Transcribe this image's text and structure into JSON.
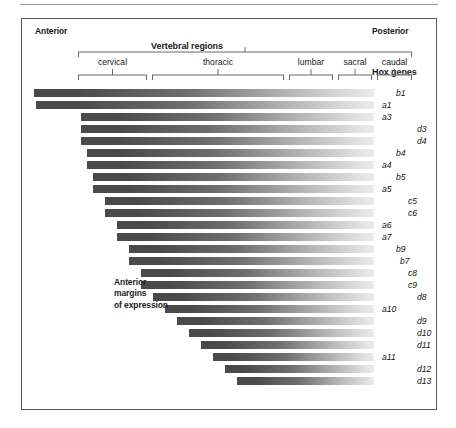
{
  "figure": {
    "anterior_label": "Anterior",
    "posterior_label": "Posterior",
    "vertebral_regions_label": "Vertebral regions",
    "hox_genes_label": "Hox genes",
    "anterior_margins_label": "Anterior\nmargins\nof expression",
    "regions": [
      {
        "name": "cervical",
        "x0": 56,
        "x1": 125
      },
      {
        "name": "thoracic",
        "x0": 130,
        "x1": 262
      },
      {
        "name": "lumbar",
        "x0": 267,
        "x1": 311
      },
      {
        "name": "sacral",
        "x0": 316,
        "x1": 350
      },
      {
        "name": "caudal",
        "x0": 355,
        "x1": 390
      }
    ],
    "bracket_span": {
      "x0": 56,
      "x1": 390
    },
    "bar_right_edge": 352,
    "colors": {
      "bar_dark": "#4a4a4a",
      "bar_light": "#ececec",
      "frame": "#5a5a5a",
      "rule": "#9a9a9a",
      "text": "#1a1a1a"
    }
  },
  "chart_data": {
    "type": "bar",
    "xlabel": "Vertebral regions (anterior → posterior)",
    "ylabel": "Hox genes",
    "grid": false,
    "legend": "none",
    "orientation": "horizontal",
    "note": "Each horizontal bar begins at the anterior margin of expression for that Hox gene and fades posteriorly. x values are pixel offsets inside the framed panel; bars all terminate at the same posterior (right) edge.",
    "categories": [
      "b1",
      "a1",
      "a3",
      "d3",
      "d4",
      "b4",
      "a4",
      "b5",
      "a5",
      "c5",
      "c6",
      "a6",
      "a7",
      "b9",
      "b7",
      "c8",
      "c9",
      "d8",
      "a10",
      "d9",
      "d10",
      "d11",
      "a11",
      "d12",
      "d13"
    ],
    "series": [
      {
        "name": "anterior margin (x start, px within panel)",
        "values": [
          12,
          14,
          59,
          59,
          59,
          65,
          65,
          71,
          71,
          83,
          83,
          95,
          95,
          107,
          107,
          119,
          119,
          131,
          143,
          155,
          167,
          179,
          191,
          203,
          215
        ]
      },
      {
        "name": "bar row y (px within panel)",
        "values": [
          70,
          82,
          94,
          106,
          118,
          130,
          142,
          154,
          166,
          178,
          190,
          202,
          214,
          226,
          238,
          250,
          262,
          274,
          286,
          298,
          310,
          322,
          334,
          346,
          358
        ]
      }
    ],
    "bars": [
      {
        "gene": "b1",
        "x": 12,
        "y": 70,
        "label_x": 40
      },
      {
        "gene": "a1",
        "x": 14,
        "y": 82,
        "label_x": 26
      },
      {
        "gene": "a3",
        "x": 59,
        "y": 94,
        "label_x": 26
      },
      {
        "gene": "d3",
        "x": 59,
        "y": 106,
        "label_x": 61
      },
      {
        "gene": "d4",
        "x": 59,
        "y": 118,
        "label_x": 61
      },
      {
        "gene": "b4",
        "x": 65,
        "y": 130,
        "label_x": 40
      },
      {
        "gene": "a4",
        "x": 65,
        "y": 142,
        "label_x": 26
      },
      {
        "gene": "b5",
        "x": 71,
        "y": 154,
        "label_x": 40
      },
      {
        "gene": "a5",
        "x": 71,
        "y": 166,
        "label_x": 26
      },
      {
        "gene": "c5",
        "x": 83,
        "y": 178,
        "label_x": 52
      },
      {
        "gene": "c6",
        "x": 83,
        "y": 190,
        "label_x": 52
      },
      {
        "gene": "a6",
        "x": 95,
        "y": 202,
        "label_x": 26
      },
      {
        "gene": "a7",
        "x": 95,
        "y": 214,
        "label_x": 26
      },
      {
        "gene": "b9",
        "x": 107,
        "y": 226,
        "label_x": 40
      },
      {
        "gene": "b7",
        "x": 107,
        "y": 238,
        "label_x": 44
      },
      {
        "gene": "c8",
        "x": 119,
        "y": 250,
        "label_x": 52
      },
      {
        "gene": "c9",
        "x": 119,
        "y": 262,
        "label_x": 52
      },
      {
        "gene": "d8",
        "x": 131,
        "y": 274,
        "label_x": 61
      },
      {
        "gene": "a10",
        "x": 143,
        "y": 286,
        "label_x": 26
      },
      {
        "gene": "d9",
        "x": 155,
        "y": 298,
        "label_x": 61
      },
      {
        "gene": "d10",
        "x": 167,
        "y": 310,
        "label_x": 61
      },
      {
        "gene": "d11",
        "x": 179,
        "y": 322,
        "label_x": 61
      },
      {
        "gene": "a11",
        "x": 191,
        "y": 334,
        "label_x": 26
      },
      {
        "gene": "d12",
        "x": 203,
        "y": 346,
        "label_x": 61
      },
      {
        "gene": "d13",
        "x": 215,
        "y": 358,
        "label_x": 61
      }
    ]
  }
}
